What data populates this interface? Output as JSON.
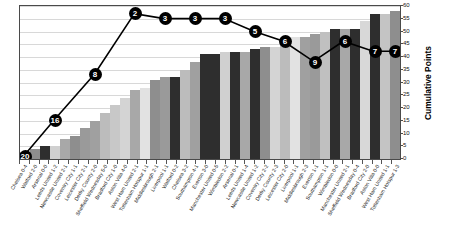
{
  "chart_data": {
    "type": "bar",
    "title": "",
    "subtitle": "",
    "xlabel": "",
    "ylabel": "Cumulative Points",
    "ylim": [
      0,
      60
    ],
    "ytick_values": [
      0,
      5,
      10,
      15,
      20,
      25,
      30,
      35,
      40,
      45,
      50,
      55,
      60
    ],
    "grid": true,
    "legend": "none",
    "categories": [
      "Chelsea",
      "Watford",
      "Arsenal",
      "Leeds United",
      "Newcastle United",
      "Coventry City",
      "Leicester City",
      "Derby County",
      "Sheffield Wednesday",
      "Bradford City",
      "Aston Villa",
      "West Ham United",
      "Tottenham Hotspur",
      "Middlesbrough",
      "Liverpool",
      "Watford",
      "Chelsea",
      "Southampton",
      "Everton",
      "Manchester United",
      "Wimbledon",
      "Arsenal",
      "Leeds United",
      "Newcastle United",
      "Coventry City",
      "Derby County",
      "Leicester City",
      "Liverpool",
      "Middlesbrough",
      "Everton",
      "Southampton",
      "Wimbledon",
      "Manchester United",
      "Sheffield Wednesday",
      "Bradford City",
      "Aston Villa",
      "West Ham United",
      "Tottenham Hotspur"
    ],
    "scores": [
      "0-4",
      "2-0",
      "0-0",
      "1-2",
      "2-1",
      "1-1",
      "2-1",
      "2-0",
      "5-0",
      "1-0",
      "4-0",
      "2-1",
      "1-1",
      "2-1",
      "1-1",
      "0-2",
      "3-2",
      "4-1",
      "3-0",
      "0-5",
      "2-2",
      "0-1",
      "1-4",
      "1-2",
      "2-2",
      "2-3",
      "2-0",
      "1-1",
      "2-3",
      "1-1",
      "1-1",
      "0-0",
      "2-1",
      "0-4",
      "2-0",
      "0-0",
      "1-1",
      "1-3"
    ],
    "values": [
      1,
      4,
      5,
      5,
      8,
      9,
      12,
      15,
      18,
      21,
      24,
      27,
      28,
      31,
      32,
      32,
      35,
      38,
      41,
      41,
      42,
      42,
      42,
      43,
      44,
      44,
      47,
      48,
      48,
      49,
      50,
      51,
      51,
      51,
      54,
      57,
      57,
      58
    ],
    "bar_shades": [
      "#9a9a9a",
      "#8e8e8e",
      "#2e2e2e",
      "#d0d0d0",
      "#a8a8a8",
      "#8e8e8e",
      "#9a9a9a",
      "#a0a0a0",
      "#bcbcbc",
      "#c8c8c8",
      "#d4d4d4",
      "#a8a8a8",
      "#e2e2e2",
      "#8e8e8e",
      "#9a9a9a",
      "#2e2e2e",
      "#bcbcbc",
      "#a0a0a0",
      "#2e2e2e",
      "#2e2e2e",
      "#d0d0d0",
      "#2e2e2e",
      "#a8a8a8",
      "#2e2e2e",
      "#8e8e8e",
      "#d4d4d4",
      "#bcbcbc",
      "#e2e2e2",
      "#a0a0a0",
      "#9a9a9a",
      "#c0c0c0",
      "#2e2e2e",
      "#a8a8a8",
      "#2e2e2e",
      "#d8d8d8",
      "#2e2e2e",
      "#c4c4c4",
      "#8e8e8e"
    ],
    "line_series": {
      "name": "League Position",
      "marker_labels": [
        "20",
        "16",
        "8",
        "2",
        "3",
        "3",
        "3",
        "5",
        "6",
        "9",
        "6",
        "7",
        "7"
      ],
      "marker_points": [
        {
          "label": "20",
          "x_index": 0,
          "y_value": 1
        },
        {
          "label": "16",
          "x_index": 3,
          "y_value": 15
        },
        {
          "label": "8",
          "x_index": 7,
          "y_value": 33
        },
        {
          "label": "2",
          "x_index": 11,
          "y_value": 57
        },
        {
          "label": "3",
          "x_index": 14,
          "y_value": 55
        },
        {
          "label": "3",
          "x_index": 17,
          "y_value": 55
        },
        {
          "label": "3",
          "x_index": 20,
          "y_value": 55
        },
        {
          "label": "5",
          "x_index": 23,
          "y_value": 50
        },
        {
          "label": "6",
          "x_index": 26,
          "y_value": 46
        },
        {
          "label": "9",
          "x_index": 29,
          "y_value": 38
        },
        {
          "label": "6",
          "x_index": 32,
          "y_value": 46
        },
        {
          "label": "7",
          "x_index": 35,
          "y_value": 42
        },
        {
          "label": "7",
          "x_index": 37,
          "y_value": 42
        }
      ]
    }
  }
}
